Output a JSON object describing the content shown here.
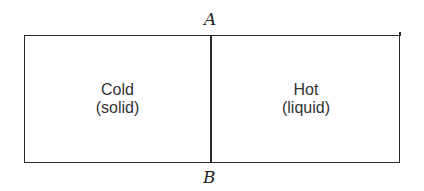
{
  "diagram": {
    "type": "divided-container",
    "boundary": {
      "top_label": "A",
      "bottom_label": "B"
    },
    "regions": [
      {
        "id": "left",
        "title": "Cold",
        "subtitle": "(solid)"
      },
      {
        "id": "right",
        "title": "Hot",
        "subtitle": "(liquid)"
      }
    ],
    "colors": {
      "line": "#2a2a2a",
      "text": "#333333",
      "background": "#ffffff"
    }
  }
}
